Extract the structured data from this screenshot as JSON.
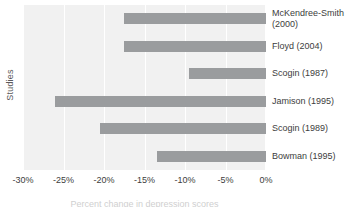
{
  "chart_data": {
    "type": "bar",
    "orientation": "horizontal",
    "title": "",
    "xlabel": "Percent change in depression scores",
    "ylabel": "Studies",
    "categories": [
      "McKendree-Smith\n(2000)",
      "Floyd (2004)",
      "Scogin (1987)",
      "Jamison (1995)",
      "Scogin (1989)",
      "Bowman (1995)"
    ],
    "values": [
      -17.5,
      -17.5,
      -9.5,
      -26.0,
      -20.5,
      -13.5
    ],
    "xlim": [
      -30,
      0
    ],
    "xticks": [
      -30,
      -25,
      -20,
      -15,
      -10,
      -5,
      0
    ],
    "xtick_labels": [
      "-30%",
      "-25%",
      "-20%",
      "-15%",
      "-10%",
      "-5%",
      "0%"
    ],
    "grid": true,
    "legend": "none",
    "bar_color": "#9a9c9e",
    "plot_background": "#f1f1f1",
    "gridline_color": "#ffffff"
  }
}
